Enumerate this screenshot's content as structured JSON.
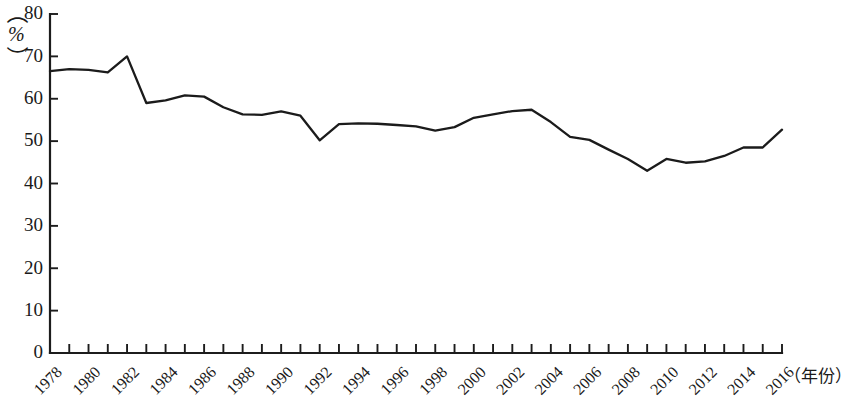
{
  "chart_data": {
    "type": "line",
    "title": "",
    "subtitle": "",
    "xlabel": "（年份）",
    "ylabel": "（%）",
    "ylabel_parts": {
      "paren_open": "（",
      "unit": "%",
      "paren_close": "）"
    },
    "ylim": [
      0,
      80
    ],
    "y_ticks": [
      0,
      10,
      20,
      30,
      40,
      50,
      60,
      70,
      80
    ],
    "y_tick_labels": [
      "0",
      "10",
      "20",
      "30",
      "40",
      "50",
      "60",
      "70",
      "80"
    ],
    "grid": false,
    "legend": null,
    "legend_position": "none",
    "x_tick_label_rotation": 45,
    "x_tick_labels_shown": [
      "1978",
      "1980",
      "1982",
      "1984",
      "1986",
      "1988",
      "1990",
      "1992",
      "1994",
      "1996",
      "1998",
      "2000",
      "2002",
      "2004",
      "2006",
      "2008",
      "2010",
      "2012",
      "2014",
      "2016"
    ],
    "x": [
      1978,
      1979,
      1980,
      1981,
      1982,
      1983,
      1984,
      1985,
      1986,
      1987,
      1988,
      1989,
      1990,
      1991,
      1992,
      1993,
      1994,
      1995,
      1996,
      1997,
      1998,
      1999,
      2000,
      2001,
      2002,
      2003,
      2004,
      2005,
      2006,
      2007,
      2008,
      2009,
      2010,
      2011,
      2012,
      2013,
      2014,
      2015,
      2016
    ],
    "values": [
      66.5,
      67.0,
      66.8,
      66.2,
      70.0,
      59.0,
      59.6,
      60.8,
      60.5,
      58.0,
      56.3,
      56.2,
      57.0,
      56.0,
      50.2,
      54.0,
      54.2,
      54.1,
      53.8,
      53.5,
      52.5,
      53.3,
      55.5,
      56.3,
      57.1,
      57.4,
      54.5,
      51.0,
      50.3,
      48.0,
      45.8,
      43.0,
      45.8,
      44.9,
      45.2,
      46.5,
      48.5,
      48.5,
      52.7
    ],
    "series": [
      {
        "name": "",
        "color": "#1b1b1b",
        "values": [
          66.5,
          67.0,
          66.8,
          66.2,
          70.0,
          59.0,
          59.6,
          60.8,
          60.5,
          58.0,
          56.3,
          56.2,
          57.0,
          56.0,
          50.2,
          54.0,
          54.2,
          54.1,
          53.8,
          53.5,
          52.5,
          53.3,
          55.5,
          56.3,
          57.1,
          57.4,
          54.5,
          51.0,
          50.3,
          48.0,
          45.8,
          43.0,
          45.8,
          44.9,
          45.2,
          46.5,
          48.5,
          48.5,
          52.7
        ]
      }
    ],
    "axis_color": "#1c1c1c",
    "line_color": "#1b1b1b",
    "background": "#ffffff"
  }
}
